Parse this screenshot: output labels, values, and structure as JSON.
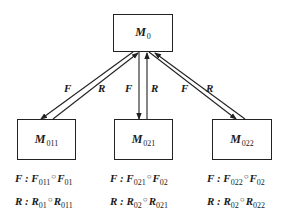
{
  "diagram": {
    "nodes": [
      {
        "id": "M0",
        "base": "M",
        "sub": "0"
      },
      {
        "id": "M011",
        "base": "M",
        "sub": "011"
      },
      {
        "id": "M021",
        "base": "M",
        "sub": "021"
      },
      {
        "id": "M022",
        "base": "M",
        "sub": "022"
      }
    ],
    "edges": [
      {
        "from": "M0",
        "to": "M011",
        "label": "F"
      },
      {
        "from": "M011",
        "to": "M0",
        "label": "R"
      },
      {
        "from": "M0",
        "to": "M021",
        "label": "F"
      },
      {
        "from": "M021",
        "to": "M0",
        "label": "R"
      },
      {
        "from": "M0",
        "to": "M022",
        "label": "F"
      },
      {
        "from": "M022",
        "to": "M0",
        "label": "R"
      }
    ],
    "formulas": {
      "M011": {
        "f": {
          "lhs": "F",
          "sep": ":",
          "a": "F",
          "a_sub": "011",
          "op": "○",
          "b": "F",
          "b_sub": "01"
        },
        "r": {
          "lhs": "R",
          "sep": ":",
          "a": "R",
          "a_sub": "01",
          "op": "○",
          "b": "R",
          "b_sub": "011"
        }
      },
      "M021": {
        "f": {
          "lhs": "F",
          "sep": ":",
          "a": "F",
          "a_sub": "021",
          "op": "○",
          "b": "F",
          "b_sub": "02"
        },
        "r": {
          "lhs": "R",
          "sep": ":",
          "a": "R",
          "a_sub": "02",
          "op": "○",
          "b": "R",
          "b_sub": "021"
        }
      },
      "M022": {
        "f": {
          "lhs": "F",
          "sep": ":",
          "a": "F",
          "a_sub": "022",
          "op": "○",
          "b": "F",
          "b_sub": "02"
        },
        "r": {
          "lhs": "R",
          "sep": ":",
          "a": "R",
          "a_sub": "02",
          "op": "○",
          "b": "R",
          "b_sub": "022"
        }
      }
    }
  }
}
